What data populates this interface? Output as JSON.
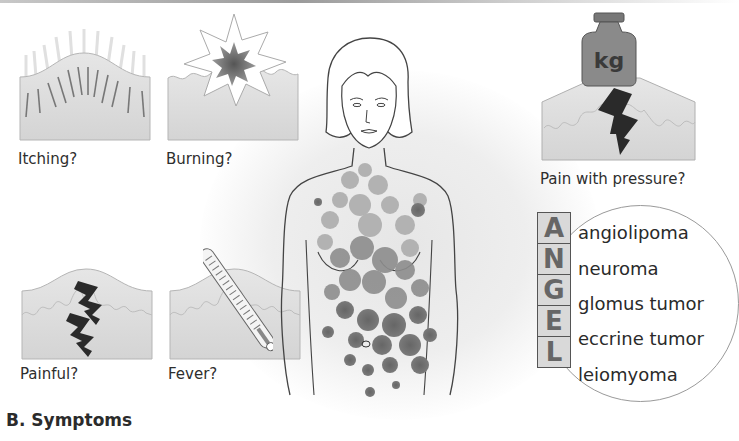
{
  "figure": {
    "caption": "B. Symptoms"
  },
  "panels": {
    "itching": {
      "label": "Itching?",
      "icon": "itch-lines-icon"
    },
    "burning": {
      "label": "Burning?",
      "icon": "burning-star-icon"
    },
    "pressure": {
      "label": "Pain with pressure?",
      "icon": "weight-icon",
      "weight_text": "kg"
    },
    "painful": {
      "label": "Painful?",
      "icon": "lightning-bolt-icon"
    },
    "fever": {
      "label": "Fever?",
      "icon": "thermometer-icon"
    }
  },
  "mnemonic": {
    "title_letters": [
      "A",
      "N",
      "G",
      "E",
      "L"
    ],
    "terms": [
      "angiolipoma",
      "neuroma",
      "glomus tumor",
      "eccrine tumor",
      "leiomyoma"
    ]
  },
  "colors": {
    "skin_fill": "#dcdcdc",
    "skin_light": "#e9e9e9",
    "lesion_dark": "#6e6e6e",
    "lesion_light": "#a8a8a8",
    "letter_box": "#d9d9d9",
    "outline": "#555555"
  }
}
